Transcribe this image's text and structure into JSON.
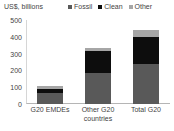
{
  "chart_data": {
    "type": "bar",
    "subtype": "stacked-bar",
    "title": "",
    "ylabel": "US$, billions",
    "xlabel": "",
    "ylim": [
      0,
      500
    ],
    "yticks": [
      500,
      400,
      300,
      200,
      100,
      0
    ],
    "grid": false,
    "legend_position": "top-right",
    "categories": [
      "G20 EMDEs",
      "Other G20 countries",
      "Total G20"
    ],
    "category_lines": [
      [
        "G20 EMDEs"
      ],
      [
        "Other G20",
        "countries"
      ],
      [
        "Total G20"
      ]
    ],
    "series": [
      {
        "name": "Fossil",
        "color": "#595959",
        "values": [
          65,
          185,
          238
        ]
      },
      {
        "name": "Clean",
        "color": "#0d0d0d",
        "values": [
          25,
          130,
          162
        ]
      },
      {
        "name": "Other",
        "color": "#a6a6a6",
        "values": [
          17,
          20,
          42
        ]
      }
    ],
    "totals": [
      107,
      335,
      442
    ]
  },
  "legend": {
    "items": [
      {
        "label": "Fossil",
        "color": "#595959"
      },
      {
        "label": "Clean",
        "color": "#0d0d0d"
      },
      {
        "label": "Other",
        "color": "#a6a6a6"
      }
    ]
  },
  "colors": {
    "fossil": "#595959",
    "clean": "#0d0d0d",
    "other": "#a6a6a6",
    "text": "#3f3f3f",
    "axis": "#b5b5b5",
    "background": "#ffffff"
  }
}
